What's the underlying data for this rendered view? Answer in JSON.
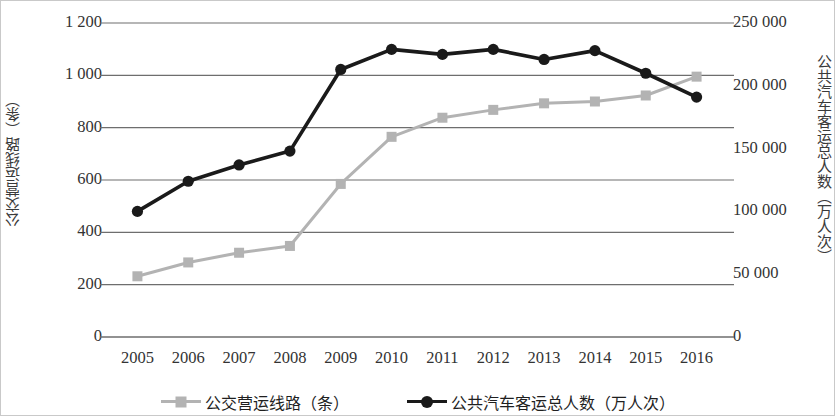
{
  "chart_data": {
    "type": "line",
    "title": "",
    "xlabel": "",
    "grid": true,
    "legend_position": "bottom",
    "categories": [
      "2005",
      "2006",
      "2007",
      "2008",
      "2009",
      "2010",
      "2011",
      "2012",
      "2013",
      "2014",
      "2015",
      "2016"
    ],
    "axes": {
      "left": {
        "label": "公交营运线路（条）",
        "ylim": [
          0,
          1200
        ],
        "tick_step": 200,
        "ticks": [
          "0",
          "200",
          "400",
          "600",
          "800",
          "1 000",
          "1 200"
        ],
        "tick_values": [
          0,
          200,
          400,
          600,
          800,
          1000,
          1200
        ]
      },
      "right": {
        "label": "公共汽车客运总人数（万人次）",
        "ylim": [
          0,
          250000
        ],
        "tick_step": 50000,
        "ticks": [
          "0",
          "50 000",
          "100 000",
          "150 000",
          "200 000",
          "250 000"
        ],
        "tick_values": [
          0,
          50000,
          100000,
          150000,
          200000,
          250000
        ]
      }
    },
    "series": [
      {
        "name": "公交营运线路（条）",
        "axis": "left",
        "color": "#b3b3b3",
        "marker": "square",
        "values": [
          232,
          285,
          322,
          348,
          585,
          765,
          838,
          868,
          893,
          900,
          923,
          995
        ]
      },
      {
        "name": "公共汽车客运总人数（万人次）",
        "axis": "right",
        "color": "#1a1a1a",
        "marker": "circle",
        "values": [
          100000,
          124000,
          137000,
          148000,
          213000,
          229000,
          225000,
          229000,
          221000,
          228000,
          210000,
          191000
        ]
      }
    ]
  },
  "legend": {
    "items": [
      {
        "label": "公交营运线路（条）",
        "color": "#b3b3b3",
        "marker": "square"
      },
      {
        "label": "公共汽车客运总人数（万人次）",
        "color": "#1a1a1a",
        "marker": "circle"
      }
    ]
  },
  "colors": {
    "series_gray": "#b3b3b3",
    "series_black": "#1a1a1a",
    "gridline": "#6e6e6e",
    "text": "#333333",
    "background": "#ffffff"
  }
}
